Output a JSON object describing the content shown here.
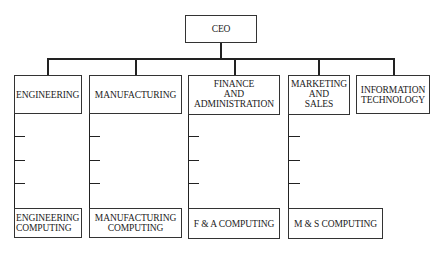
{
  "diagram": {
    "type": "org-chart",
    "root": {
      "label": "CEO"
    },
    "departments": [
      {
        "label": "ENGINEERING",
        "computing": "ENGINEERING\nCOMPUTING"
      },
      {
        "label": "MANUFACTURING",
        "computing": "MANUFACTURING\nCOMPUTING"
      },
      {
        "label": "FINANCE\nAND\nADMINISTRATION",
        "computing": "F & A COMPUTING"
      },
      {
        "label": "MARKETING\nAND\nSALES",
        "computing": "M & S COMPUTING"
      },
      {
        "label": "INFORMATION\nTECHNOLOGY"
      }
    ]
  }
}
